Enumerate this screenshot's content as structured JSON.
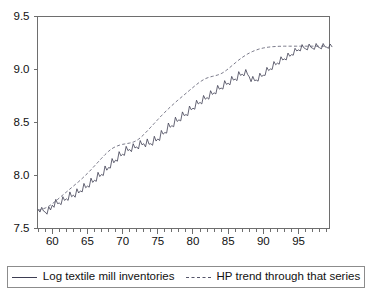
{
  "chart_data": {
    "type": "line",
    "title": "",
    "xlabel": "",
    "ylabel": "",
    "xlim": [
      1957.9,
      1999.4
    ],
    "ylim": [
      7.5,
      9.5
    ],
    "grid": false,
    "legend_position": "bottom",
    "ytick_labels": [
      "9.5",
      "9.0",
      "8.5",
      "8.0",
      "7.5"
    ],
    "ytick_values": [
      9.5,
      9.0,
      8.5,
      8.0,
      7.5
    ],
    "xtick_labels": [
      "60",
      "65",
      "70",
      "75",
      "80",
      "85",
      "90",
      "95"
    ],
    "xtick_values": [
      1960,
      1965,
      1970,
      1975,
      1980,
      1985,
      1990,
      1995
    ],
    "xminor_step": 1,
    "series": [
      {
        "name": "Log textile mill inventories",
        "style": "solid",
        "color": "#3d3d52",
        "x_start": 1958.0,
        "x_step": 0.25,
        "values": [
          7.68,
          7.655,
          7.7,
          7.665,
          7.655,
          7.635,
          7.705,
          7.675,
          7.72,
          7.7,
          7.775,
          7.735,
          7.74,
          7.725,
          7.8,
          7.765,
          7.78,
          7.765,
          7.845,
          7.8,
          7.815,
          7.795,
          7.875,
          7.835,
          7.855,
          7.845,
          7.925,
          7.885,
          7.9,
          7.89,
          7.975,
          7.935,
          7.955,
          7.945,
          8.03,
          7.99,
          8.01,
          8.0,
          8.09,
          8.05,
          8.075,
          8.07,
          8.16,
          8.12,
          8.145,
          8.135,
          8.225,
          8.185,
          8.2,
          8.19,
          8.275,
          8.235,
          8.245,
          8.225,
          8.3,
          8.26,
          8.27,
          8.25,
          8.33,
          8.29,
          8.3,
          8.27,
          8.345,
          8.295,
          8.3,
          8.285,
          8.37,
          8.325,
          8.345,
          8.33,
          8.425,
          8.39,
          8.405,
          8.4,
          8.495,
          8.455,
          8.47,
          8.46,
          8.55,
          8.51,
          8.525,
          8.515,
          8.6,
          8.565,
          8.575,
          8.565,
          8.655,
          8.62,
          8.635,
          8.625,
          8.71,
          8.675,
          8.69,
          8.675,
          8.755,
          8.72,
          8.735,
          8.72,
          8.8,
          8.765,
          8.78,
          8.77,
          8.85,
          8.815,
          8.825,
          8.815,
          8.895,
          8.86,
          8.87,
          8.855,
          8.935,
          8.9,
          8.91,
          8.895,
          8.98,
          8.945,
          8.955,
          8.94,
          9.0,
          8.955,
          8.93,
          8.885,
          8.935,
          8.895,
          8.9,
          8.89,
          8.965,
          8.935,
          8.945,
          8.945,
          9.02,
          8.99,
          9.005,
          9.0,
          9.075,
          9.045,
          9.06,
          9.05,
          9.12,
          9.09,
          9.1,
          9.09,
          9.155,
          9.125,
          9.14,
          9.135,
          9.2,
          9.175,
          9.185,
          9.175,
          9.235,
          9.205,
          9.195,
          9.185,
          9.24,
          9.21,
          9.2,
          9.19,
          9.245,
          9.215,
          9.205,
          9.195,
          9.245,
          9.215,
          9.21,
          9.2,
          9.24,
          9.215
        ]
      },
      {
        "name": "HP trend through that series",
        "style": "dashed",
        "color": "#55556a",
        "x_start": 1958.0,
        "x_step": 0.25,
        "values": [
          7.672,
          7.676,
          7.681,
          7.687,
          7.693,
          7.701,
          7.71,
          7.721,
          7.733,
          7.746,
          7.76,
          7.774,
          7.788,
          7.802,
          7.816,
          7.83,
          7.844,
          7.858,
          7.872,
          7.886,
          7.9,
          7.914,
          7.928,
          7.942,
          7.957,
          7.972,
          7.988,
          8.004,
          8.02,
          8.037,
          8.054,
          8.072,
          8.09,
          8.108,
          8.126,
          8.144,
          8.162,
          8.18,
          8.197,
          8.213,
          8.228,
          8.242,
          8.254,
          8.264,
          8.272,
          8.279,
          8.285,
          8.29,
          8.294,
          8.297,
          8.3,
          8.303,
          8.306,
          8.31,
          8.315,
          8.322,
          8.331,
          8.342,
          8.355,
          8.37,
          8.386,
          8.403,
          8.42,
          8.438,
          8.456,
          8.474,
          8.492,
          8.51,
          8.528,
          8.546,
          8.563,
          8.58,
          8.597,
          8.613,
          8.629,
          8.645,
          8.66,
          8.675,
          8.69,
          8.705,
          8.719,
          8.733,
          8.747,
          8.761,
          8.775,
          8.789,
          8.803,
          8.817,
          8.831,
          8.845,
          8.858,
          8.871,
          8.883,
          8.894,
          8.904,
          8.913,
          8.92,
          8.926,
          8.931,
          8.935,
          8.939,
          8.943,
          8.948,
          8.954,
          8.961,
          8.97,
          8.981,
          8.993,
          9.006,
          9.02,
          9.034,
          9.048,
          9.062,
          9.076,
          9.089,
          9.102,
          9.114,
          9.125,
          9.136,
          9.146,
          9.155,
          9.163,
          9.171,
          9.178,
          9.184,
          9.19,
          9.195,
          9.199,
          9.203,
          9.206,
          9.209,
          9.211,
          9.213,
          9.215,
          9.216,
          9.217,
          9.218,
          9.219,
          9.219,
          9.22,
          9.22,
          9.22,
          9.22,
          9.22,
          9.22,
          9.22,
          9.22,
          9.22,
          9.22,
          9.22,
          9.22,
          9.22,
          9.22,
          9.22,
          9.22,
          9.22,
          9.22,
          9.22,
          9.22,
          9.22,
          9.22,
          9.22,
          9.22,
          9.22
        ]
      }
    ]
  },
  "legend": {
    "entries": [
      {
        "label": "Log textile mill inventories",
        "style": "solid"
      },
      {
        "label": "HP trend through that series",
        "style": "dashed"
      }
    ]
  }
}
